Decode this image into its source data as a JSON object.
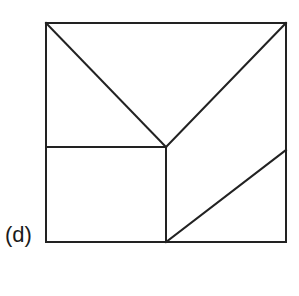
{
  "figure": {
    "label": "(d)",
    "stroke_color": "#222222",
    "stroke_width": 2,
    "outer_square": {
      "x": 46,
      "y": 23,
      "width": 240,
      "height": 219
    },
    "segments": [
      {
        "name": "diagonal-top-left-to-center",
        "x1": 46,
        "y1": 23,
        "x2": 166,
        "y2": 147
      },
      {
        "name": "diagonal-top-right-to-center",
        "x1": 286,
        "y1": 23,
        "x2": 166,
        "y2": 147
      },
      {
        "name": "horizontal-left-mid",
        "x1": 46,
        "y1": 147,
        "x2": 166,
        "y2": 147
      },
      {
        "name": "vertical-center-down",
        "x1": 166,
        "y1": 147,
        "x2": 166,
        "y2": 242
      },
      {
        "name": "diagonal-bottom-center-to-right",
        "x1": 166,
        "y1": 242,
        "x2": 286,
        "y2": 150
      }
    ]
  }
}
